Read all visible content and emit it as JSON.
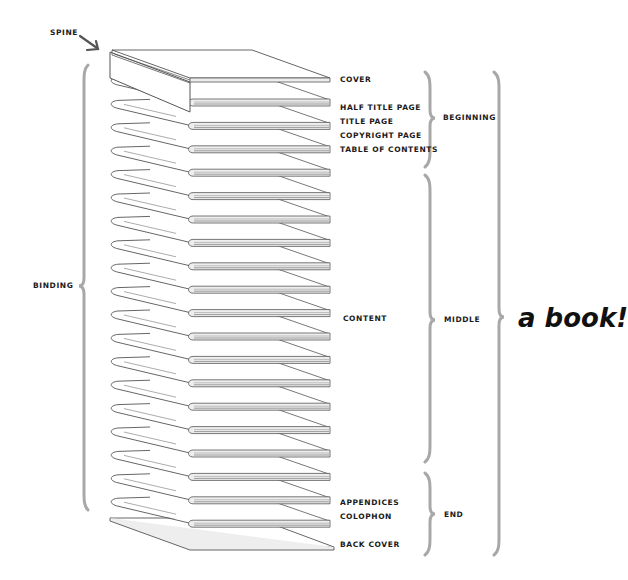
{
  "diagram": {
    "title": "a book!",
    "colors": {
      "line": "#555555",
      "brace": "#a8a8a8",
      "text": "#1a1a1a",
      "page_fill": "#ffffff",
      "edge_fill": "#eeeeee"
    },
    "spine_label": "SPINE",
    "binding_label": "BINDING",
    "page_labels": {
      "cover": "COVER",
      "half_title": "HALF TITLE PAGE",
      "title": "TITLE PAGE",
      "copyright": "COPYRIGHT PAGE",
      "toc": "TABLE OF CONTENTS",
      "content": "CONTENT",
      "appendices": "APPENDICES",
      "colophon": "COLOPHON",
      "back_cover": "BACK COVER"
    },
    "sections": {
      "beginning": "BEGINNING",
      "middle": "MIDDLE",
      "end": "END"
    },
    "folio_count": 19
  }
}
